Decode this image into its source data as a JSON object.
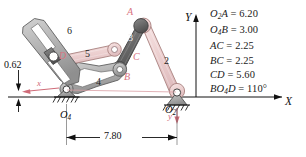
{
  "figure": {
    "type": "mechanism-linkage-diagram",
    "colors": {
      "link_pink_fill": "#eecfcf",
      "link_pink_edge": "#b98f93",
      "link_gray_fill": "#b4b4b4",
      "link_gray_edge": "#6e6e6e",
      "link_dark_fill": "#6f6f6f",
      "label_pink": "#d8737f",
      "axis_black": "#111111",
      "local_axis_red": "#cf6b78"
    }
  },
  "axes": {
    "x_label": "X",
    "y_label": "Y",
    "local_x_label": "x",
    "local_y_label": "y"
  },
  "points": [
    {
      "id": "A",
      "label": "A",
      "color": "pink"
    },
    {
      "id": "B",
      "label": "B",
      "color": "pink"
    },
    {
      "id": "C",
      "label": "C",
      "color": "pink"
    },
    {
      "id": "D",
      "label": "D",
      "color": "pink"
    },
    {
      "id": "O2",
      "label": "O",
      "sub": "2",
      "color": "dark"
    },
    {
      "id": "O4",
      "label": "O",
      "sub": "4",
      "color": "dark"
    }
  ],
  "link_numbers": [
    {
      "id": "link2",
      "label": "2"
    },
    {
      "id": "link3",
      "label": "3"
    },
    {
      "id": "link4",
      "label": "4"
    },
    {
      "id": "link5",
      "label": "5"
    },
    {
      "id": "link6",
      "label": "6"
    }
  ],
  "dimensions": [
    {
      "id": "horizontal-span",
      "label": "7.80"
    },
    {
      "id": "vertical-offset",
      "label": "0.62"
    }
  ],
  "specs": [
    {
      "id": "O2A",
      "name": "O",
      "sub": "2",
      "name2": "A",
      "eq": "=",
      "value": "6.20"
    },
    {
      "id": "O4B",
      "name": "O",
      "sub": "4",
      "name2": "B",
      "eq": "=",
      "value": "3.00"
    },
    {
      "id": "AC",
      "name": "AC",
      "sub": "",
      "name2": "",
      "eq": "=",
      "value": "2.25"
    },
    {
      "id": "BC",
      "name": "BC",
      "sub": "",
      "name2": "",
      "eq": "=",
      "value": "2.25"
    },
    {
      "id": "CD",
      "name": "CD",
      "sub": "",
      "name2": "",
      "eq": "=",
      "value": "5.60"
    },
    {
      "id": "BO4D",
      "name": "BO",
      "sub": "4",
      "name2": "D",
      "eq": "=",
      "value": "110°"
    }
  ]
}
